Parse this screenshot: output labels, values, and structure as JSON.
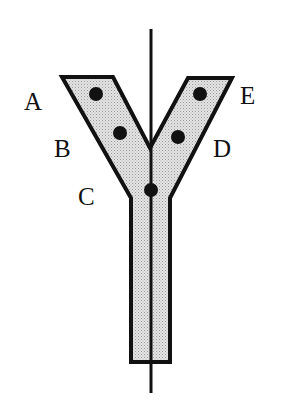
{
  "diagram": {
    "title": "",
    "colors": {
      "background": "#ffffff",
      "stroke": "#111111",
      "fill": "#d9d9d9",
      "dot": "#111111"
    },
    "axis": {
      "x": 151,
      "y1": 29,
      "y2": 393
    },
    "shape": {
      "outline_points": "62,77 113,77 150,148 188,78 232,78 170,198 170,362 131,362 131,198"
    },
    "points": [
      {
        "id": "A",
        "cx": 96,
        "cy": 94,
        "r": 7
      },
      {
        "id": "B",
        "cx": 120,
        "cy": 133,
        "r": 7
      },
      {
        "id": "C",
        "cx": 151,
        "cy": 190,
        "r": 7
      },
      {
        "id": "D",
        "cx": 178,
        "cy": 137,
        "r": 7
      },
      {
        "id": "E",
        "cx": 200,
        "cy": 94,
        "r": 7
      }
    ],
    "labels": [
      {
        "text": "A",
        "x": 24,
        "y": 110
      },
      {
        "text": "B",
        "x": 54,
        "y": 157
      },
      {
        "text": "C",
        "x": 78,
        "y": 205
      },
      {
        "text": "D",
        "x": 213,
        "y": 157
      },
      {
        "text": "E",
        "x": 240,
        "y": 104
      }
    ]
  }
}
